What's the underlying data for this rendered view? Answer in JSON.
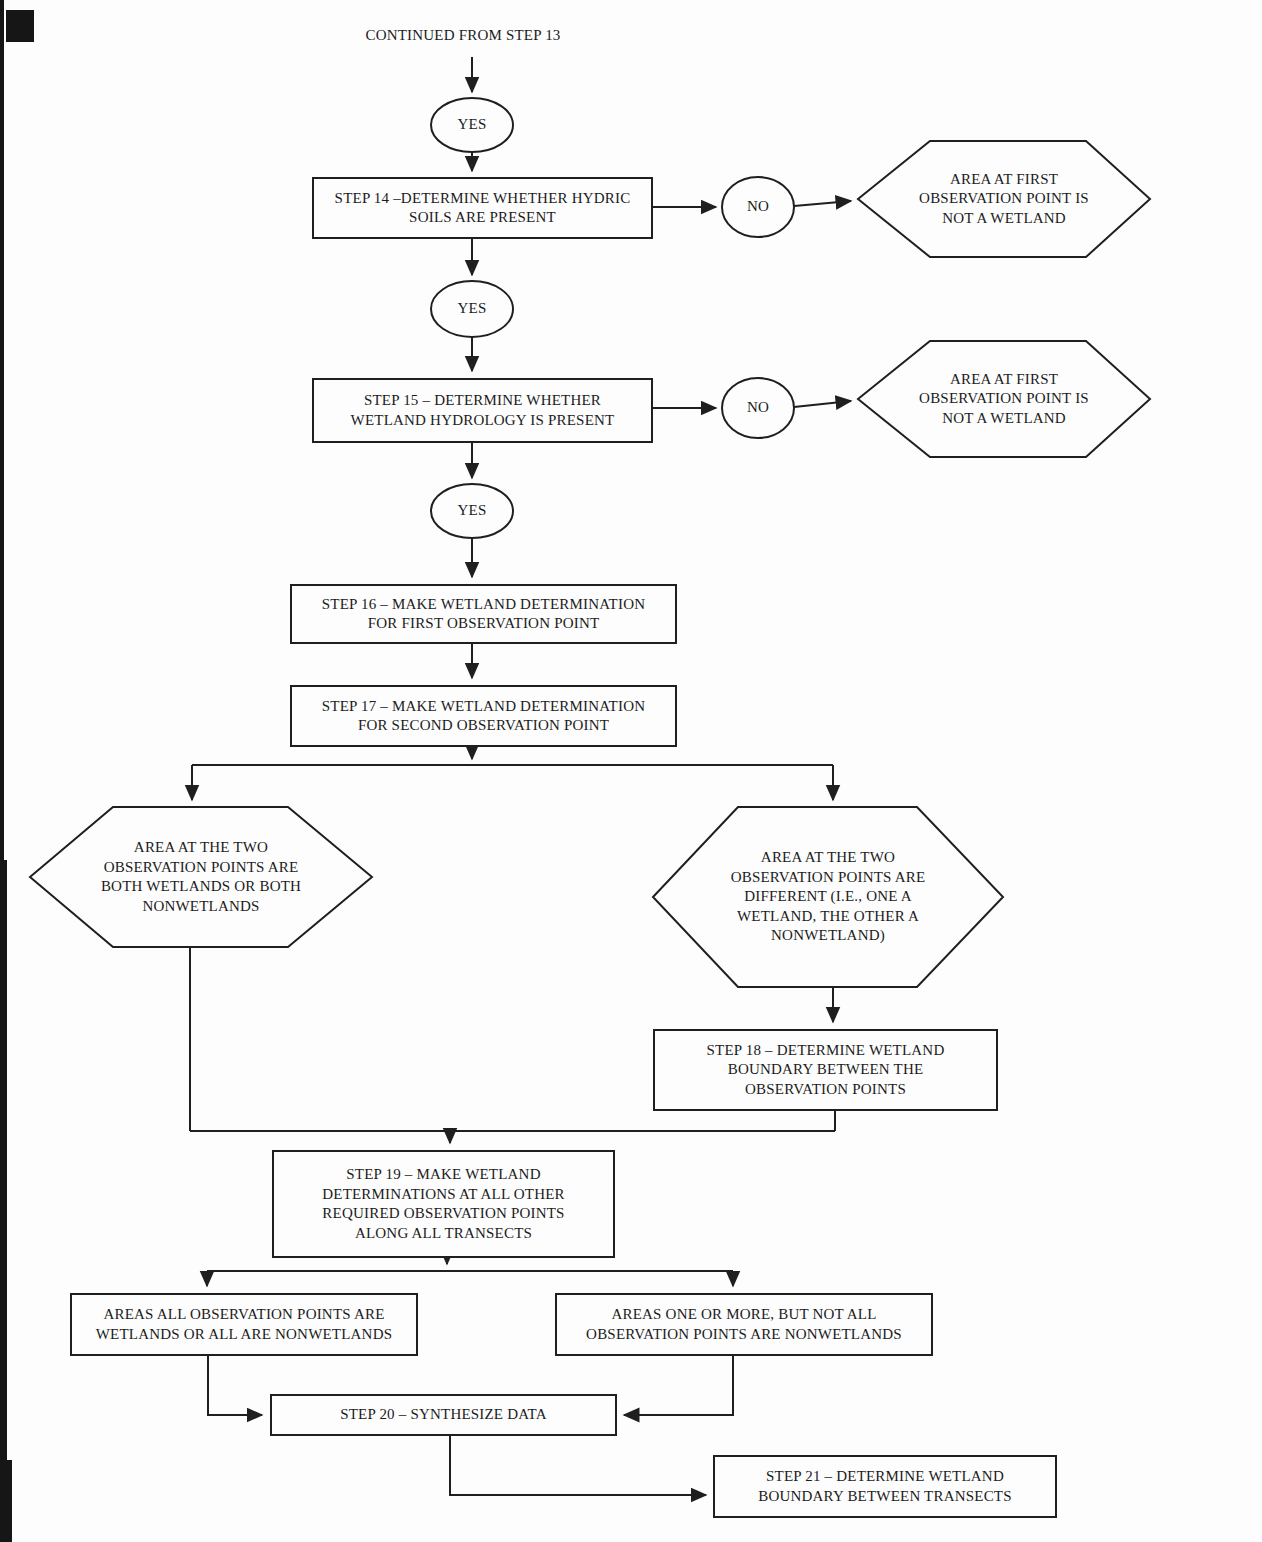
{
  "diagram": {
    "title": "CONTINUED FROM STEP 13",
    "connectors": {
      "yes": "YES",
      "no": "NO"
    },
    "colors": {
      "ink": "#1f1f1f",
      "paper": "#fdfdfd"
    },
    "nodes": {
      "step14": {
        "lines": [
          "STEP 14 –DETERMINE WHETHER HYDRIC",
          "SOILS ARE PRESENT"
        ]
      },
      "step15": {
        "lines": [
          "STEP 15 – DETERMINE WHETHER",
          "WETLAND HYDROLOGY IS PRESENT"
        ]
      },
      "step16": {
        "lines": [
          "STEP 16 – MAKE WETLAND DETERMINATION",
          "FOR FIRST OBSERVATION POINT"
        ]
      },
      "step17": {
        "lines": [
          "STEP 17 – MAKE WETLAND DETERMINATION",
          "FOR SECOND OBSERVATION POINT"
        ]
      },
      "step18": {
        "lines": [
          "STEP 18 – DETERMINE WETLAND",
          "BOUNDARY BETWEEN THE",
          "OBSERVATION POINTS"
        ]
      },
      "step19": {
        "lines": [
          "STEP 19 – MAKE WETLAND",
          "DETERMINATIONS AT ALL OTHER",
          "REQUIRED OBSERVATION POINTS",
          "ALONG ALL TRANSECTS"
        ]
      },
      "step20": {
        "lines": [
          "STEP 20 – SYNTHESIZE DATA"
        ]
      },
      "step21": {
        "lines": [
          "STEP 21 – DETERMINE WETLAND",
          "BOUNDARY BETWEEN TRANSECTS"
        ]
      },
      "not_wetland_1": {
        "lines": [
          "AREA AT FIRST",
          "OBSERVATION POINT IS",
          "NOT A WETLAND"
        ]
      },
      "not_wetland_2": {
        "lines": [
          "AREA AT FIRST",
          "OBSERVATION POINT IS",
          "NOT A WETLAND"
        ]
      },
      "both_same": {
        "lines": [
          "AREA AT THE TWO",
          "OBSERVATION POINTS ARE",
          "BOTH WETLANDS OR BOTH",
          "NONWETLANDS"
        ]
      },
      "different": {
        "lines": [
          "AREA AT THE TWO",
          "OBSERVATION POINTS ARE",
          "DIFFERENT (I.E., ONE A",
          "WETLAND, THE OTHER A",
          "NONWETLAND)"
        ]
      },
      "all_same": {
        "lines": [
          "AREAS ALL OBSERVATION POINTS ARE",
          "WETLANDS OR ALL ARE NONWETLANDS"
        ]
      },
      "not_all": {
        "lines": [
          "AREAS ONE OR MORE, BUT NOT ALL",
          "OBSERVATION POINTS ARE NONWETLANDS"
        ]
      }
    }
  }
}
